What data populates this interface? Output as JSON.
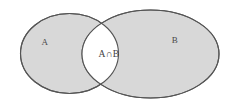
{
  "figure": {
    "kind": "venn-diagram",
    "background_color": "#ffffff",
    "fill_color": "#d8d8d8",
    "stroke_color": "#555555",
    "intersection_fill": "#ffffff",
    "sets": [
      {
        "id": "set-a",
        "label": "A",
        "label_x": 45,
        "label_y": 45,
        "cx": 69.5,
        "cy": 53.5,
        "rx": 49,
        "ry": 40
      },
      {
        "id": "set-b",
        "label": "B",
        "label_x": 175,
        "label_y": 43,
        "cx": 150.5,
        "cy": 54,
        "rx": 68.5,
        "ry": 44
      }
    ],
    "intersection": {
      "id": "set-intersection",
      "label": "A∩B",
      "label_x": 109,
      "label_y": 57
    }
  }
}
